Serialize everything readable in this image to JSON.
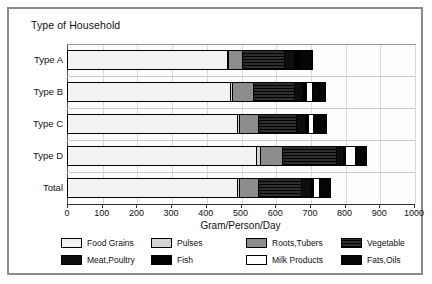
{
  "chart": {
    "title": "Type of Household",
    "xlabel": "Gram/Person/Day"
  },
  "axis": {
    "ticks": [
      "0",
      "100",
      "200",
      "300",
      "400",
      "500",
      "600",
      "700",
      "800",
      "900",
      "1000"
    ]
  },
  "legend": {
    "items": [
      {
        "label": "Food Grains",
        "key": "food_grains",
        "color": "#f2f2f2",
        "cls": "f-foodgrains"
      },
      {
        "label": "Pulses",
        "key": "pulses",
        "color": "#d4d4d4",
        "cls": "f-pulses"
      },
      {
        "label": "Roots,Tubers",
        "key": "roots_tubers",
        "color": "#8c8c8c",
        "cls": "f-roots"
      },
      {
        "label": "Vegetable",
        "key": "vegetable",
        "color": "#1a1a1a",
        "cls": "f-vegetable"
      },
      {
        "label": "Meat,Poultry",
        "key": "meat_poultry",
        "color": "#0d0d0d",
        "cls": "f-meat"
      },
      {
        "label": "Fish",
        "key": "fish",
        "color": "#000000",
        "cls": "f-fish"
      },
      {
        "label": "Milk Products",
        "key": "milk_products",
        "color": "#ffffff",
        "cls": "f-milk"
      },
      {
        "label": "Fats,Oils",
        "key": "fats_oils",
        "color": "#050505",
        "cls": "f-fats"
      }
    ]
  },
  "chart_data": {
    "type": "bar",
    "orientation": "horizontal",
    "stacked": true,
    "title": "Type of Household",
    "xlabel": "Gram/Person/Day",
    "ylabel": "",
    "xlim": [
      0,
      1000
    ],
    "xticks": [
      0,
      100,
      200,
      300,
      400,
      500,
      600,
      700,
      800,
      900,
      1000
    ],
    "grid": true,
    "legend_position": "bottom",
    "categories": [
      "Type A",
      "Type B",
      "Type C",
      "Type D",
      "Total"
    ],
    "series": [
      {
        "name": "Food Grains",
        "values": [
          460,
          470,
          490,
          545,
          490
        ]
      },
      {
        "name": "Pulses",
        "values": [
          5,
          5,
          5,
          10,
          5
        ]
      },
      {
        "name": "Roots,Tubers",
        "values": [
          40,
          60,
          55,
          65,
          55
        ]
      },
      {
        "name": "Vegetable",
        "values": [
          120,
          120,
          110,
          155,
          125
        ]
      },
      {
        "name": "Meat,Poultry",
        "values": [
          30,
          25,
          25,
          20,
          25
        ]
      },
      {
        "name": "Fish",
        "values": [
          10,
          10,
          10,
          5,
          10
        ]
      },
      {
        "name": "Milk Products",
        "values": [
          5,
          15,
          15,
          30,
          15
        ]
      },
      {
        "name": "Fats,Oils",
        "values": [
          40,
          40,
          40,
          35,
          35
        ]
      }
    ],
    "totals": [
      710,
      745,
      750,
      865,
      760
    ]
  }
}
